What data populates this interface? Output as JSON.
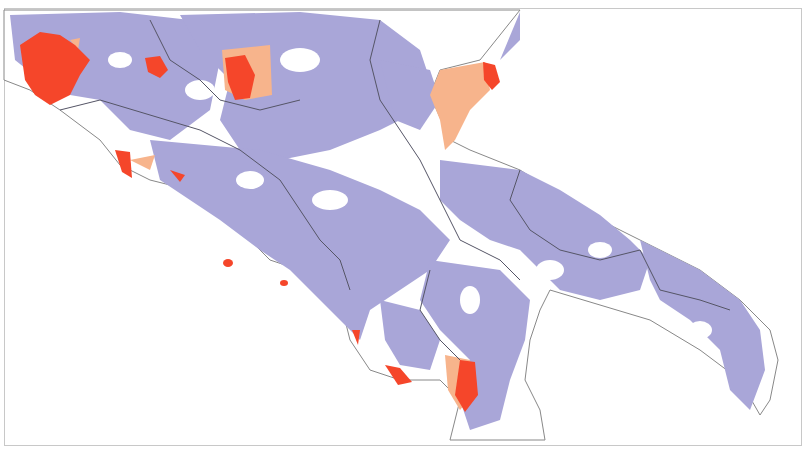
{
  "map": {
    "title": "",
    "region": "Southern Italy (Lazio, Abruzzo, Molise, Campania, Puglia, Basilicata, Calabria)",
    "legend_visible": false,
    "colors": {
      "background": "#ffffff",
      "sea": "#ffffff",
      "land_base": "#ffffff",
      "category_low": "#a9a6d8",
      "category_mid": "#f7b48c",
      "category_high": "#f5462a",
      "boundary": "#555566",
      "coastline": "#888888",
      "frame": "#c8c8c8"
    },
    "categories": [
      {
        "id": "low",
        "color": "#a9a6d8"
      },
      {
        "id": "mid",
        "color": "#f7b48c"
      },
      {
        "id": "high",
        "color": "#f5462a"
      }
    ],
    "highlighted_areas": [
      {
        "name": "rome-area",
        "category": "high"
      },
      {
        "name": "rieti-area",
        "category": "high"
      },
      {
        "name": "laquila-area",
        "category": "high"
      },
      {
        "name": "circeo-coast",
        "category": "high"
      },
      {
        "name": "gargano-peninsula",
        "category": "mid"
      },
      {
        "name": "gargano-east-tip",
        "category": "high"
      },
      {
        "name": "cilento-coast",
        "category": "high"
      },
      {
        "name": "maratea-coast",
        "category": "high"
      },
      {
        "name": "ponza-islands",
        "category": "high"
      },
      {
        "name": "ischia-capri",
        "category": "high"
      }
    ]
  }
}
